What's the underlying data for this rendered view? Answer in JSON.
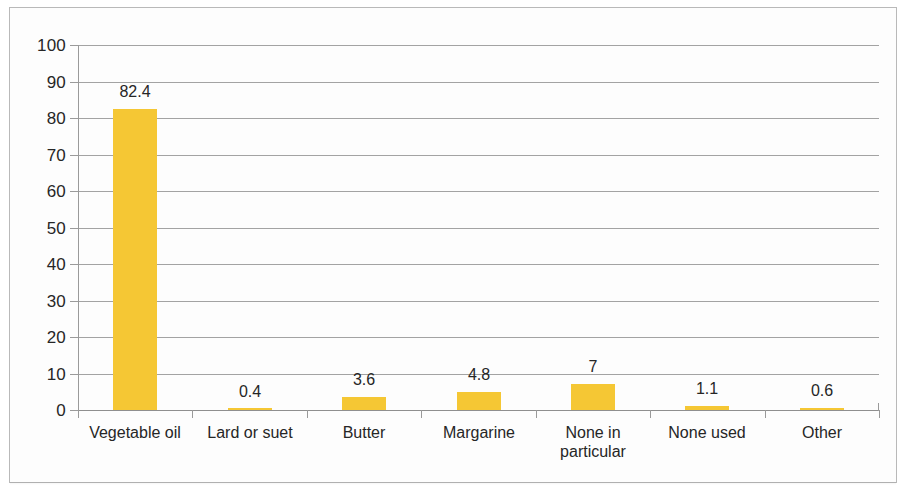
{
  "chart_data": {
    "type": "bar",
    "title": "",
    "subtitle": "",
    "xlabel": "",
    "ylabel": "",
    "categories": [
      "Vegetable oil",
      "Lard or suet",
      "Butter",
      "Margarine",
      "None in\nparticular",
      "None used",
      "Other"
    ],
    "values": [
      82.4,
      0.4,
      3.6,
      4.8,
      7,
      1.1,
      0.6
    ],
    "value_labels": [
      "82.4",
      "0.4",
      "3.6",
      "4.8",
      "7",
      "1.1",
      "0.6"
    ],
    "ylim": [
      0,
      100
    ],
    "ytick_labels": [
      "100",
      "90",
      "80",
      "70",
      "60",
      "50",
      "40",
      "30",
      "20",
      "10",
      "0"
    ],
    "ytick_values": [
      100,
      90,
      80,
      70,
      60,
      50,
      40,
      30,
      20,
      10,
      0
    ],
    "ytick_step": 10,
    "grid": true,
    "grid_axis": "y",
    "legend": false,
    "legend_position": "none",
    "series": [
      {
        "name": "",
        "color": "#f5c734",
        "values": [
          82.4,
          0.4,
          3.6,
          4.8,
          7,
          1.1,
          0.6
        ]
      }
    ]
  },
  "colors": {
    "bar": "#f5c734",
    "gridline": "#a3a3a3",
    "axis": "#9a9a9a",
    "text": "#262626",
    "page_background": "#fdfdfd",
    "frame_border": "#b9b9b9"
  }
}
